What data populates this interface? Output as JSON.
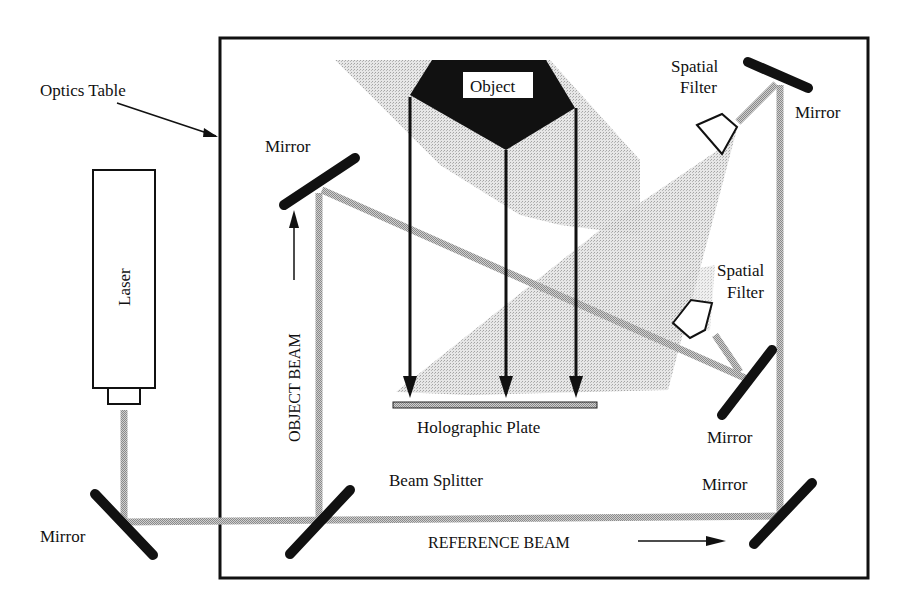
{
  "diagram": {
    "colors": {
      "ink": "#111111",
      "beam_gray": "#b8b8b8",
      "light_cone_gray": "#d6d6d6",
      "background": "#ffffff"
    },
    "labels": {
      "optics_table": "Optics Table",
      "laser": "Laser",
      "object": "Object",
      "object_beam": "OBJECT BEAM",
      "reference_beam": "REFERENCE BEAM",
      "holographic_plate": "Holographic Plate",
      "beam_splitter": "Beam Splitter",
      "spatial_filter_top_line1": "Spatial",
      "spatial_filter_top_line2": "Filter",
      "spatial_filter_mid_line1": "Spatial",
      "spatial_filter_mid_line2": "Filter",
      "mirror_upper_left": "Mirror",
      "mirror_top_right": "Mirror",
      "mirror_mid_right": "Mirror",
      "mirror_bottom_right": "Mirror",
      "mirror_outside_left": "Mirror"
    },
    "components": [
      {
        "id": "laser",
        "type": "laser"
      },
      {
        "id": "mirror-outside-left",
        "type": "mirror"
      },
      {
        "id": "beam-splitter",
        "type": "beam-splitter"
      },
      {
        "id": "mirror-upper-left",
        "type": "mirror"
      },
      {
        "id": "mirror-bottom-right",
        "type": "mirror"
      },
      {
        "id": "mirror-top-right",
        "type": "mirror"
      },
      {
        "id": "mirror-mid-right",
        "type": "mirror"
      },
      {
        "id": "spatial-filter-top",
        "type": "spatial-filter"
      },
      {
        "id": "spatial-filter-mid",
        "type": "spatial-filter"
      },
      {
        "id": "object",
        "type": "object"
      },
      {
        "id": "holographic-plate",
        "type": "plate"
      },
      {
        "id": "optics-table",
        "type": "table"
      }
    ],
    "arrows": [
      {
        "id": "object-beam-arrow",
        "direction": "up"
      },
      {
        "id": "reference-beam-arrow",
        "direction": "right"
      },
      {
        "id": "optics-table-pointer",
        "direction": "down-right"
      },
      {
        "id": "object-light-arrows",
        "count": 3,
        "direction": "down"
      }
    ]
  }
}
